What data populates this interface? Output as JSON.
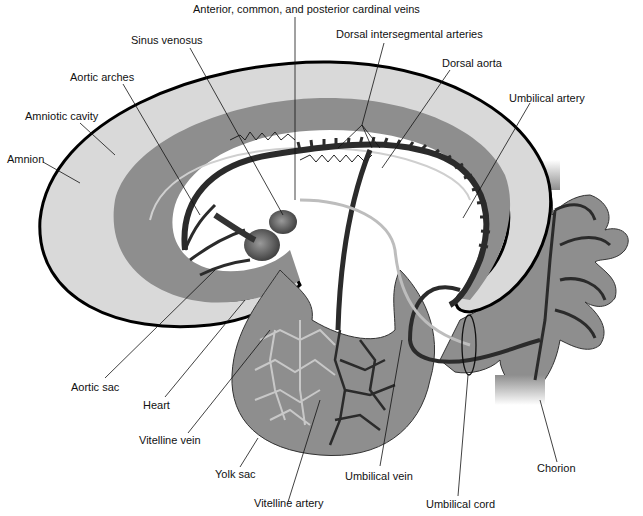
{
  "diagram": {
    "colors": {
      "amnion_outline": "#000000",
      "amniotic_cavity": "#d9d9d9",
      "embryo_tissue": "#8e8e8e",
      "vessels_dark": "#2b2b2b",
      "vessels_light": "#bdbdbd",
      "background": "#ffffff"
    }
  },
  "labels": {
    "cardinal_veins": "Anterior, common, and posterior cardinal veins",
    "sinus_venosus": "Sinus venosus",
    "dorsal_intersegmental": "Dorsal intersegmental arteries",
    "dorsal_aorta": "Dorsal aorta",
    "aortic_arches": "Aortic arches",
    "umbilical_artery": "Umbilical artery",
    "amniotic_cavity": "Amniotic cavity",
    "amnion": "Amnion",
    "aortic_sac": "Aortic sac",
    "heart": "Heart",
    "vitelline_vein": "Vitelline vein",
    "yolk_sac": "Yolk sac",
    "vitelline_artery": "Vitelline artery",
    "umbilical_vein": "Umbilical vein",
    "umbilical_cord": "Umbilical cord",
    "chorion": "Chorion"
  }
}
